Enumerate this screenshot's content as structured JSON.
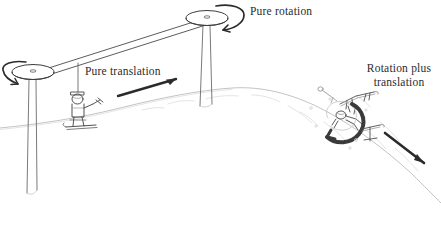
{
  "figure": {
    "name": "ski-lift-motion-types-diagram",
    "background_color": "#ffffff",
    "ink_color": "#2b2b2b",
    "mid_ink_color": "#555555",
    "light_ink_color": "#b9b9b9",
    "width": 441,
    "height": 227
  },
  "labels": {
    "pure_rotation": "Pure rotation",
    "pure_translation": "Pure translation",
    "rotation_plus_translation": "Rotation plus\ntranslation"
  },
  "annotations": {
    "left_pulley": "rotating-disc-left",
    "right_pulley": "rotating-disc-right",
    "cable": "lift-cable",
    "chair_rider": "seated-skier-on-lift",
    "tumbling_skier": "tumbling-skier",
    "hill": "snow-hill-slope",
    "rotation_arrow_left": "counterclockwise-rotation-arrow",
    "rotation_arrow_right": "counterclockwise-rotation-arrow",
    "translation_arrow": "straight-translation-arrow",
    "tumble_rotation_arrow": "circular-rotation-arrow",
    "tumble_translation_arrow": "diagonal-translation-arrow"
  }
}
